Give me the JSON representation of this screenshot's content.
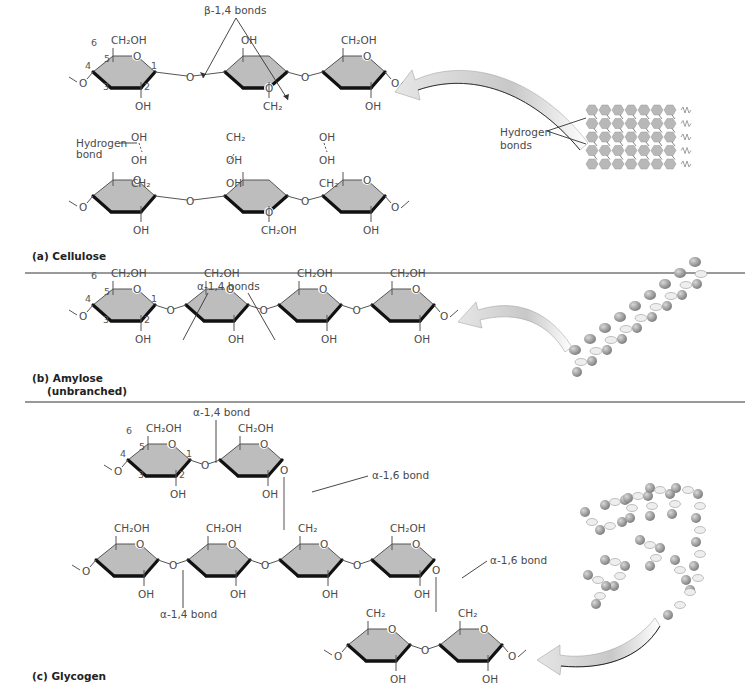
{
  "figure": {
    "panels": [
      {
        "id": "a",
        "title": "(a) Cellulose",
        "bond_label": "β-1,4 bonds",
        "hydrogen_bond_label": [
          "Hydrogen",
          "bond"
        ],
        "model_label": [
          "Hydrogen",
          "bonds"
        ],
        "position_numbers": [
          "6",
          "5",
          "4",
          "3",
          "2",
          "1"
        ],
        "top_row": [
          {
            "x": 125,
            "y": 72,
            "flip": false,
            "top": "CH₂OH",
            "bottom": "OH"
          },
          {
            "x": 255,
            "y": 72,
            "flip": true,
            "top": "OH",
            "bottom": "CH₂"
          },
          {
            "x": 355,
            "y": 72,
            "flip": false,
            "top": "CH₂OH",
            "bottom": "OH"
          }
        ],
        "middle_labels": [
          {
            "x": 137,
            "texts": [
              "OH",
              "OH",
              "CH₂"
            ]
          },
          {
            "x": 232,
            "texts": [
              "CH₂",
              "OH",
              "OH"
            ]
          },
          {
            "x": 325,
            "texts": [
              "OH",
              "OH",
              "CH₂"
            ]
          }
        ],
        "bottom_row": [
          {
            "x": 125,
            "y": 196,
            "flip": false,
            "top": "",
            "bottom": "OH"
          },
          {
            "x": 255,
            "y": 196,
            "flip": true,
            "top": "",
            "bottom": "CH₂OH"
          },
          {
            "x": 355,
            "y": 196,
            "flip": false,
            "top": "",
            "bottom": "OH"
          }
        ]
      },
      {
        "id": "b",
        "title": "(b) Amylose",
        "subtitle": "(unbranched)",
        "bond_label": "α-1,4 bonds",
        "position_numbers": [
          "6",
          "5",
          "4",
          "3",
          "2",
          "1"
        ],
        "rings": [
          {
            "x": 125,
            "y": 305,
            "top": "CH₂OH",
            "bottom": "OH"
          },
          {
            "x": 218,
            "y": 305,
            "top": "CH₂OH",
            "bottom": "OH"
          },
          {
            "x": 311,
            "y": 305,
            "top": "CH₂OH",
            "bottom": "OH"
          },
          {
            "x": 404,
            "y": 305,
            "top": "CH₂OH",
            "bottom": "OH"
          }
        ]
      },
      {
        "id": "c",
        "title": "(c) Glycogen",
        "bond_14_top": "α-1,4 bond",
        "bond_14_bottom": "α-1,4 bond",
        "bond_16_top": "α-1,6 bond",
        "bond_16_bottom": "α-1,6 bond",
        "position_numbers": [
          "6",
          "5",
          "4",
          "3",
          "2",
          "1"
        ],
        "top_branch": [
          {
            "x": 160,
            "y": 460,
            "top": "CH₂OH",
            "bottom": "OH"
          },
          {
            "x": 252,
            "y": 460,
            "top": "CH₂OH",
            "bottom": "OH"
          }
        ],
        "main_chain": [
          {
            "x": 128,
            "y": 560,
            "top": "CH₂OH",
            "bottom": "OH"
          },
          {
            "x": 220,
            "y": 560,
            "top": "CH₂OH",
            "bottom": "OH"
          },
          {
            "x": 312,
            "y": 560,
            "top": "CH₂",
            "bottom": "OH"
          },
          {
            "x": 404,
            "y": 560,
            "top": "CH₂OH",
            "bottom": "OH"
          }
        ],
        "bottom_branch": [
          {
            "x": 380,
            "y": 645,
            "top": "CH₂",
            "bottom": "OH"
          },
          {
            "x": 472,
            "y": 645,
            "top": "CH₂",
            "bottom": "OH"
          }
        ]
      }
    ],
    "colors": {
      "ring_fill": "#bdbdbd",
      "ring_edge": "#111111",
      "text": "#4a4a4a",
      "divider": "#777777",
      "arrow_fill": "#d0d0d0"
    }
  }
}
